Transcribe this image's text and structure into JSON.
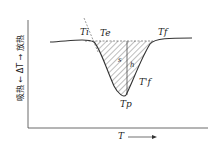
{
  "diagram": {
    "y_axis_label": "吸热 ← ΔT → 放热",
    "x_axis_label": "T →",
    "labels": {
      "Ti": "Ti",
      "Te": "Te",
      "Tf": "Tf",
      "s": "s",
      "h": "h",
      "Tf_prime": "T'f",
      "Tp": "Tp"
    },
    "colors": {
      "line": "#333333",
      "hatch": "#444444"
    }
  }
}
